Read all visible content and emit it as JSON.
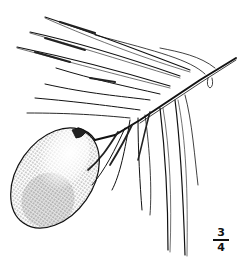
{
  "figure": {
    "scale": {
      "numerator": "3",
      "denominator": "4"
    },
    "colors": {
      "ink": "#111111",
      "paper": "#ffffff"
    }
  }
}
